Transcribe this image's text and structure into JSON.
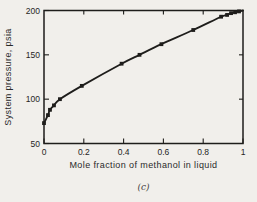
{
  "figure": {
    "caption": "(c)"
  },
  "chart_data": {
    "type": "line",
    "title": "",
    "xlabel": "Mole fraction of methanol in liquid",
    "ylabel": "System pressure, psia",
    "caption": "(c)",
    "xlim": [
      0,
      1
    ],
    "ylim": [
      50,
      200
    ],
    "xticks": [
      0,
      0.2,
      0.4,
      0.6,
      0.8,
      1
    ],
    "xtick_labels": [
      "0",
      "0.2",
      "0.4",
      "0.6",
      "0.8",
      "1"
    ],
    "yticks": [
      50,
      100,
      150,
      200
    ],
    "ytick_labels": [
      "50",
      "100",
      "150",
      "200"
    ],
    "grid": false,
    "legend": "none",
    "frame": "box",
    "series": [
      {
        "name": "bubble-point pressure curve",
        "marker": "filled-square",
        "x": [
          0.0,
          0.02,
          0.03,
          0.05,
          0.08,
          0.19,
          0.39,
          0.48,
          0.59,
          0.75,
          0.89,
          0.92,
          0.94,
          0.96,
          0.98
        ],
        "y": [
          73,
          82,
          88,
          93,
          100,
          115,
          140,
          150,
          162,
          178,
          193,
          195,
          197,
          198,
          199
        ]
      }
    ],
    "curve_end": {
      "x": 1.0,
      "y": 200
    },
    "colors": {
      "ink": "#1e1d1b",
      "background": "#f1efeb"
    }
  }
}
